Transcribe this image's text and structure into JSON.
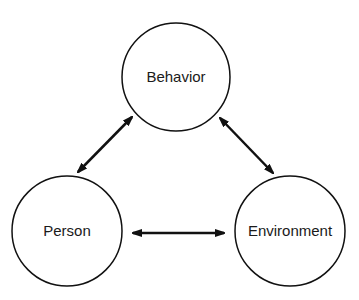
{
  "diagram": {
    "type": "triadic reciprocal model",
    "colors": {
      "stroke": "#111111",
      "text": "#1a1a1a",
      "background": "#ffffff"
    },
    "nodes": [
      {
        "id": "behavior",
        "label": "Behavior",
        "cx": 176,
        "cy": 77,
        "r": 54
      },
      {
        "id": "person",
        "label": "Person",
        "cx": 67,
        "cy": 231,
        "r": 55
      },
      {
        "id": "environment",
        "label": "Environment",
        "cx": 290,
        "cy": 231,
        "r": 55
      }
    ],
    "edges": [
      {
        "from": "person",
        "to": "behavior",
        "bidirectional": true,
        "x1": 78,
        "y1": 172,
        "x2": 132,
        "y2": 117
      },
      {
        "from": "behavior",
        "to": "environment",
        "bidirectional": true,
        "x1": 220,
        "y1": 118,
        "x2": 273,
        "y2": 173
      },
      {
        "from": "person",
        "to": "environment",
        "bidirectional": true,
        "x1": 133,
        "y1": 233,
        "x2": 224,
        "y2": 233
      }
    ]
  }
}
